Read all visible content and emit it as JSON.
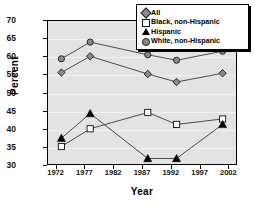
{
  "chart_data": {
    "type": "line",
    "title": "",
    "xlabel": "Year",
    "ylabel": "Percent",
    "xlim": [
      1970.5,
      2003.5
    ],
    "ylim": [
      30,
      70
    ],
    "xticks": [
      1972,
      1977,
      1982,
      1987,
      1992,
      1997,
      2002
    ],
    "yticks": [
      30,
      35,
      40,
      45,
      50,
      55,
      60,
      65,
      70
    ],
    "grid": true,
    "legend_position": "top-right",
    "x": [
      1973,
      1978,
      1988,
      1993,
      2001
    ],
    "series": [
      {
        "name": "All",
        "marker": "diamond",
        "color": "#8a8a8a",
        "values": [
          55.5,
          60.0,
          55.1,
          52.9,
          55.3
        ]
      },
      {
        "name": "Black, non-Hispanic",
        "marker": "square",
        "color": "#ffffff",
        "values": [
          35.1,
          40.0,
          44.5,
          41.2,
          42.7
        ]
      },
      {
        "name": "Hispanic",
        "marker": "triangle",
        "color": "#000000",
        "values": [
          37.4,
          44.2,
          31.8,
          31.8,
          41.2
        ]
      },
      {
        "name": "White, non-Hispanic",
        "marker": "circle",
        "color": "#8a8a8a",
        "values": [
          59.3,
          63.9,
          60.4,
          58.9,
          61.4
        ]
      }
    ]
  },
  "legend": {
    "items": [
      {
        "label": "All",
        "marker": "diamond"
      },
      {
        "label": "Black, non-Hispanic",
        "marker": "square"
      },
      {
        "label": "Hispanic",
        "marker": "triangle"
      },
      {
        "label": "White, non-Hispanic",
        "marker": "circle"
      }
    ]
  },
  "axes": {
    "y_title": "Percent",
    "x_title": "Year",
    "y_tick_labels": [
      "70",
      "65",
      "60",
      "55",
      "50",
      "45",
      "40",
      "35",
      "30"
    ],
    "x_tick_labels": [
      "1972",
      "1977",
      "1982",
      "1987",
      "1992",
      "1997",
      "2002"
    ]
  }
}
